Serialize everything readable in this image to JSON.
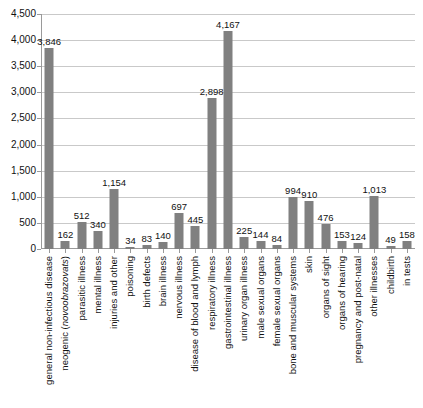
{
  "chart_data": {
    "type": "bar",
    "title": "",
    "subtitle": "",
    "xlabel": "",
    "ylabel": "",
    "ylim": [
      0,
      4500
    ],
    "ytick_step": 500,
    "yticks": [
      "0",
      "500",
      "1,000",
      "1,500",
      "2,000",
      "2,500",
      "3,000",
      "3,500",
      "4,000",
      "4,500"
    ],
    "ytick_values": [
      0,
      500,
      1000,
      1500,
      2000,
      2500,
      3000,
      3500,
      4000,
      4500
    ],
    "grid": "horizontal",
    "legend": "none",
    "bar_color": "#808080",
    "grid_color": "#c9c9c9",
    "axis_color": "#9a9a9a",
    "categories": [
      "general non-infectious disease",
      "neogenic (novoobrazovats)",
      "parasitic illness",
      "mental illness",
      "injuries and other",
      "poisoning",
      "birth defects",
      "brain illness",
      "nervous illness",
      "disease of blood and lymph",
      "respiratory illness",
      "gastrointestinal illness",
      "urinary organ illness",
      "male sexual organs",
      "female sexual organs",
      "bone and muscular systems",
      "skin",
      "organs of sight",
      "organs of hearing",
      "pregnancy and post-natal",
      "other illnesses",
      "childbirth",
      "in tests"
    ],
    "category_italic_part": {
      "1": "novoobrazovats"
    },
    "values": [
      3846,
      162,
      512,
      340,
      1154,
      34,
      83,
      140,
      697,
      445,
      2898,
      4167,
      225,
      144,
      84,
      994,
      910,
      476,
      153,
      124,
      1013,
      49,
      158
    ],
    "value_labels": [
      "3,846",
      "162",
      "512",
      "340",
      "1,154",
      "34",
      "83",
      "140",
      "697",
      "445",
      "2,898",
      "4,167",
      "225",
      "144",
      "84",
      "994",
      "910",
      "476",
      "153",
      "124",
      "1,013",
      "49",
      "158"
    ]
  }
}
